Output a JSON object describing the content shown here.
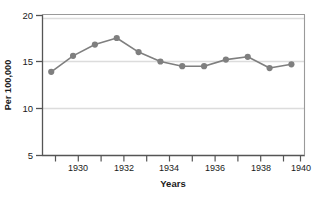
{
  "chart_data": {
    "type": "line",
    "title": "",
    "subtitle": "",
    "xlabel": "Years",
    "ylabel": "Per 100,000",
    "x": [
      1929,
      1930,
      1931,
      1932,
      1933,
      1934,
      1935,
      1936,
      1937,
      1938,
      1939,
      1940
    ],
    "values": [
      13.9,
      15.6,
      16.8,
      17.5,
      16.0,
      15.0,
      14.5,
      14.5,
      15.2,
      15.5,
      14.3,
      14.7
    ],
    "series": [
      {
        "name": "Rate per 100,000",
        "values": [
          13.9,
          15.6,
          16.8,
          17.5,
          16.0,
          15.0,
          14.5,
          14.5,
          15.2,
          15.5,
          14.3,
          14.7
        ]
      }
    ],
    "xlim": [
      1928.6,
      1940.6
    ],
    "ylim": [
      5,
      20
    ],
    "ytick_labels": [
      "5",
      "10",
      "15",
      "20"
    ],
    "yticks": [
      5,
      10,
      15,
      20
    ],
    "xtick_labels": [
      "1930",
      "1932",
      "1934",
      "1936",
      "1938",
      "1940"
    ],
    "xticks": [
      1930,
      1932,
      1934,
      1936,
      1938,
      1940
    ],
    "xticks_minor": [
      1929,
      1931,
      1933,
      1935,
      1937,
      1939
    ],
    "grid": "horizontal",
    "legend": "none",
    "annotations": [],
    "colors": {
      "line": "#7f7f7f",
      "marker": "#7f7f7f",
      "grid": "#d4d4d4",
      "axis": "#4d4d4d",
      "text": "#1a1a1a",
      "background": "#ffffff"
    },
    "marker": "circle",
    "line_width": 1.6,
    "marker_size": 3.1
  }
}
